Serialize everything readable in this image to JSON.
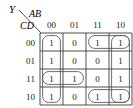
{
  "diagram": {
    "kind": "karnaugh-map",
    "output_label": "Y",
    "column_variables_label": "AB",
    "row_variables_label": "CD",
    "column_headers": [
      "00",
      "01",
      "11",
      "10"
    ],
    "row_headers": [
      "00",
      "01",
      "11",
      "10"
    ],
    "cells": [
      [
        "1",
        "0",
        "1",
        "1"
      ],
      [
        "1",
        "0",
        "0",
        "1"
      ],
      [
        "1",
        "1",
        "0",
        "1"
      ],
      [
        "1",
        "0",
        "1",
        "1"
      ]
    ],
    "groups": [
      {
        "name": "group-column-00-all-rows",
        "col": 0,
        "row": 0,
        "cols": 1,
        "rows": 4,
        "wrap": "none"
      },
      {
        "name": "group-column-10-all-rows",
        "col": 3,
        "row": 0,
        "cols": 1,
        "rows": 4,
        "wrap": "none"
      },
      {
        "name": "group-row-00-cols-11-10",
        "col": 2,
        "row": 0,
        "cols": 2,
        "rows": 1,
        "wrap": "none"
      },
      {
        "name": "group-row-10-cols-11-10",
        "col": 2,
        "row": 3,
        "cols": 2,
        "rows": 1,
        "wrap": "none"
      },
      {
        "name": "group-row-11-cols-00-01",
        "col": 0,
        "row": 2,
        "cols": 2,
        "rows": 1,
        "wrap": "none"
      }
    ],
    "colors": {
      "grid_line": "#3b3b3b",
      "group_line": "#5a5a5a",
      "text": "#1a1a1a",
      "background": "#ffffff"
    }
  }
}
